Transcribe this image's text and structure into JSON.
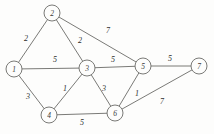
{
  "figure": {
    "background_color": "#fdfdfc",
    "stroke_color": "#6b6b68",
    "text_color": "#2e2e2c"
  },
  "chart_data": {
    "type": "diagram",
    "title": "",
    "xlabel": "",
    "ylabel": "",
    "grid": false,
    "legend": "none",
    "graph_kind": "undirected-weighted-graph",
    "nodes": [
      {
        "id": "1",
        "label": "1",
        "x": 14,
        "y": 69,
        "r": 8
      },
      {
        "id": "2",
        "label": "2",
        "x": 52,
        "y": 13,
        "r": 8
      },
      {
        "id": "3",
        "label": "3",
        "x": 87,
        "y": 68,
        "r": 8
      },
      {
        "id": "4",
        "label": "4",
        "x": 49,
        "y": 115,
        "r": 8
      },
      {
        "id": "5",
        "label": "5",
        "x": 143,
        "y": 66,
        "r": 8
      },
      {
        "id": "6",
        "label": "6",
        "x": 115,
        "y": 113,
        "r": 8
      },
      {
        "id": "7",
        "label": "7",
        "x": 199,
        "y": 66,
        "r": 8
      }
    ],
    "edges": [
      {
        "source": "1",
        "target": "2",
        "weight": "2",
        "label_x": 26,
        "label_y": 38
      },
      {
        "source": "2",
        "target": "3",
        "weight": "2",
        "label_x": 80,
        "label_y": 40
      },
      {
        "source": "2",
        "target": "5",
        "weight": "7",
        "label_x": 108,
        "label_y": 30
      },
      {
        "source": "1",
        "target": "3",
        "weight": "5",
        "label_x": 55,
        "label_y": 59
      },
      {
        "source": "3",
        "target": "5",
        "weight": "5",
        "label_x": 113,
        "label_y": 59
      },
      {
        "source": "5",
        "target": "7",
        "weight": "5",
        "label_x": 170,
        "label_y": 58
      },
      {
        "source": "1",
        "target": "4",
        "weight": "3",
        "label_x": 28,
        "label_y": 96
      },
      {
        "source": "3",
        "target": "4",
        "weight": "1",
        "label_x": 65,
        "label_y": 88
      },
      {
        "source": "3",
        "target": "6",
        "weight": "3",
        "label_x": 104,
        "label_y": 88
      },
      {
        "source": "5",
        "target": "6",
        "weight": "1",
        "label_x": 137,
        "label_y": 93
      },
      {
        "source": "4",
        "target": "6",
        "weight": "5",
        "label_x": 82,
        "label_y": 122
      },
      {
        "source": "6",
        "target": "7",
        "weight": "7",
        "label_x": 162,
        "label_y": 101
      }
    ],
    "adjacency_summary": [
      "1-2 = 2",
      "2-3 = 2",
      "2-5 = 7",
      "1-3 = 5",
      "3-5 = 5",
      "5-7 = 5",
      "1-4 = 3",
      "3-4 = 1",
      "3-6 = 3",
      "5-6 = 1",
      "4-6 = 5",
      "6-7 = 7"
    ]
  }
}
